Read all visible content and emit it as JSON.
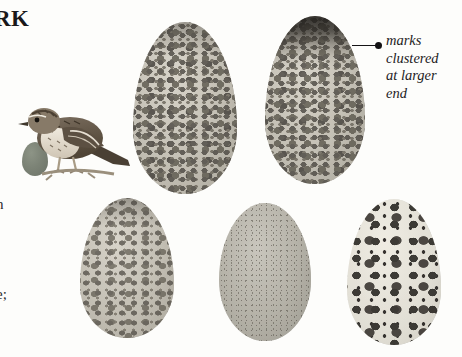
{
  "page": {
    "title_fragment": "RK",
    "margin_fragments": [
      "h",
      "e;"
    ],
    "background_color": "#fdfdfb"
  },
  "callout": {
    "lines": [
      "marks",
      "clustered",
      "at larger",
      "end"
    ],
    "marker": "leader-dot",
    "ink_color": "#1d1c1e"
  },
  "figure": {
    "bird": {
      "name": "perched-lark",
      "description": "streaked brown lark perched on a twig, facing left",
      "plumage_color": "#6d6154",
      "belly_color": "#e4ddd0"
    },
    "size_reference": {
      "name": "size-reference-oval",
      "color": "#7c8376"
    },
    "eggs": [
      {
        "id": "egg-1",
        "ground_color": "#c3bfb4",
        "mark_color": "#4e4a44",
        "pattern": "densely mottled gray-brown speckling over whole shell",
        "cap": "soft"
      },
      {
        "id": "egg-2",
        "ground_color": "#c3bfb4",
        "mark_color": "#4e4a44",
        "pattern": "speckled with marks clustered into a dark cap at the larger end",
        "cap": "dark"
      },
      {
        "id": "egg-3",
        "ground_color": "#c3bfb4",
        "mark_color": "#4b4740",
        "pattern": "medium speckling, denser toward the margins",
        "cap": "soft"
      },
      {
        "id": "egg-4",
        "ground_color": "#b4b1a7",
        "mark_color": "#55514a",
        "pattern": "uniform fine stippling, no bold blotches",
        "cap": "none"
      },
      {
        "id": "egg-5",
        "ground_color": "#e2dfd5",
        "mark_color": "#2b2824",
        "pattern": "pale whitish ground with bold discrete dark spots",
        "cap": "none"
      }
    ]
  }
}
